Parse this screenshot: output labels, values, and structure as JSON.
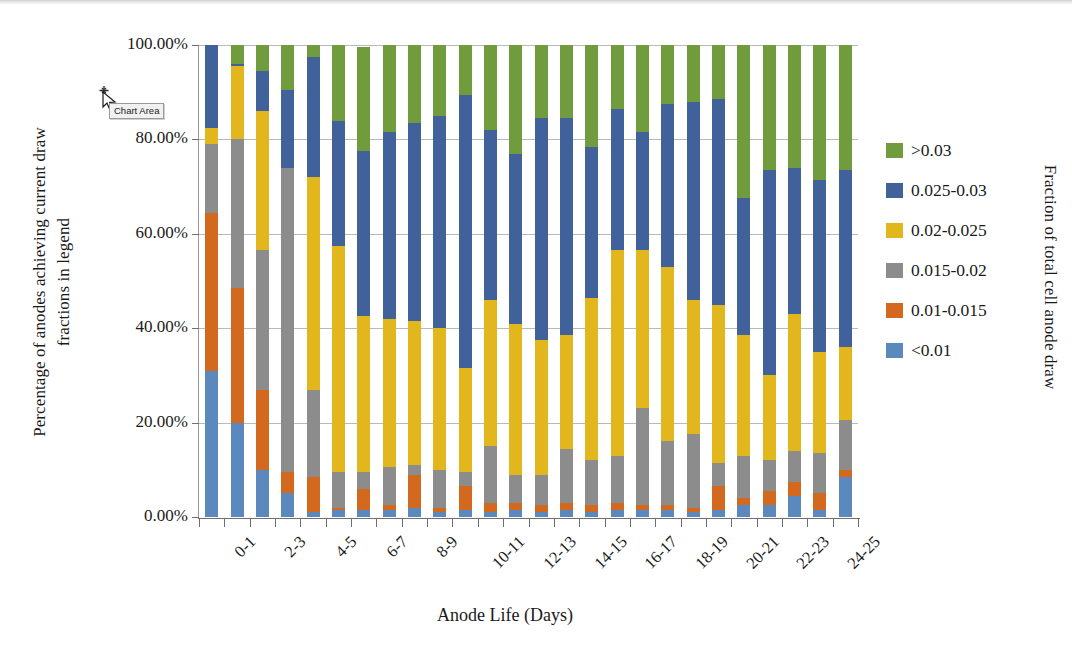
{
  "chart_data": {
    "type": "bar",
    "subtype": "stacked-percent-column",
    "title": "",
    "xlabel": "Anode Life (Days)",
    "ylabel": "Percentage of anodes achieving current draw fractions in legend",
    "ylabel_line1": "Percentage of anodes achieving current draw",
    "ylabel_line2": "fractions in legend",
    "secondary_axis_label": "Fraction of total cell anode draw",
    "ylim": [
      0,
      100
    ],
    "ytick_labels": [
      "100.00%",
      "80.00%",
      "60.00%",
      "40.00%",
      "20.00%",
      "0.00%"
    ],
    "ytick_values": [
      100,
      80,
      60,
      40,
      20,
      0
    ],
    "grid": true,
    "legend_position": "right",
    "categories": [
      "0-1",
      "1-2",
      "2-3",
      "3-4",
      "4-5",
      "5-6",
      "6-7",
      "7-8",
      "8-9",
      "9-10",
      "10-11",
      "11-12",
      "12-13",
      "13-14",
      "14-15",
      "15-16",
      "16-17",
      "17-18",
      "18-19",
      "19-20",
      "20-21",
      "21-22",
      "22-23",
      "23-24",
      "24-25",
      "25-26"
    ],
    "visible_tick_labels": [
      "0-1",
      "2-3",
      "4-5",
      "6-7",
      "8-9",
      "10-11",
      "12-13",
      "14-15",
      "16-17",
      "18-19",
      "20-21",
      "22-23",
      "24-25"
    ],
    "series": [
      {
        "name": "<0.01",
        "color": "#5B89BD",
        "values": [
          31.0,
          20.0,
          10.0,
          5.0,
          1.0,
          1.5,
          1.5,
          1.5,
          2.0,
          1.0,
          1.5,
          1.0,
          1.5,
          1.0,
          1.5,
          1.0,
          1.5,
          1.5,
          1.5,
          1.0,
          1.5,
          2.5,
          2.5,
          4.5,
          1.5,
          8.5
        ]
      },
      {
        "name": "0.01-0.015",
        "color": "#D2691E",
        "values": [
          33.5,
          28.5,
          17.0,
          4.5,
          7.5,
          0.5,
          4.5,
          1.0,
          7.0,
          1.0,
          5.0,
          2.0,
          1.5,
          1.5,
          1.5,
          1.5,
          1.5,
          1.0,
          1.0,
          1.0,
          5.0,
          1.5,
          3.0,
          3.0,
          3.5,
          1.5
        ]
      },
      {
        "name": "0.015-0.02",
        "color": "#8C8C8C",
        "values": [
          14.5,
          31.5,
          29.5,
          64.5,
          18.5,
          7.5,
          3.5,
          8.0,
          2.0,
          8.0,
          3.0,
          12.0,
          6.0,
          6.5,
          11.5,
          9.5,
          10.0,
          20.5,
          13.5,
          15.5,
          5.0,
          9.0,
          6.5,
          6.5,
          8.5,
          10.5
        ]
      },
      {
        "name": "0.02-0.025",
        "color": "#E2B71E",
        "values": [
          3.5,
          15.5,
          29.5,
          0.0,
          45.0,
          48.0,
          33.0,
          31.5,
          30.5,
          30.0,
          22.0,
          31.0,
          32.0,
          28.5,
          24.0,
          34.5,
          43.5,
          33.5,
          37.0,
          28.5,
          33.5,
          25.5,
          18.0,
          29.0,
          21.5,
          15.5
        ]
      },
      {
        "name": "0.025-0.03",
        "color": "#41619B",
        "values": [
          17.5,
          0.5,
          8.5,
          16.5,
          25.5,
          26.5,
          35.0,
          39.5,
          42.0,
          45.0,
          58.0,
          36.0,
          36.0,
          47.0,
          46.0,
          32.0,
          30.0,
          25.0,
          34.5,
          42.0,
          43.5,
          29.0,
          43.5,
          31.0,
          36.5,
          37.5
        ]
      },
      {
        "name": ">0.03",
        "color": "#709C3D",
        "values": [
          0.0,
          4.0,
          5.5,
          9.5,
          2.5,
          16.0,
          22.0,
          18.5,
          16.5,
          15.0,
          10.5,
          18.0,
          23.0,
          15.5,
          15.5,
          21.5,
          13.5,
          18.5,
          12.5,
          12.0,
          11.5,
          32.5,
          26.5,
          26.0,
          28.5,
          26.5
        ]
      }
    ],
    "legend_entries": [
      {
        "label": ">0.03",
        "color": "#709C3D"
      },
      {
        "label": "0.025-0.03",
        "color": "#41619B"
      },
      {
        "label": "0.02-0.025",
        "color": "#E2B71E"
      },
      {
        "label": "0.015-0.02",
        "color": "#8C8C8C"
      },
      {
        "label": "0.01-0.015",
        "color": "#D2691E"
      },
      {
        "label": "<0.01",
        "color": "#5B89BD"
      }
    ]
  },
  "overlay": {
    "tooltip_text": "Chart Area",
    "cursor": "move-cursor"
  }
}
